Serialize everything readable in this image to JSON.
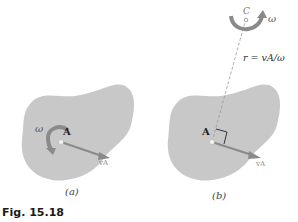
{
  "figure": {
    "caption": "Fig. 15.18",
    "colors": {
      "body_fill": "#c8c8c8",
      "vector": "#8a8a8a",
      "dashed_line": "#999999",
      "point": "#f2f2f2"
    },
    "panel_a": {
      "sublabel": "(a)",
      "point_label": "A",
      "angular_velocity_label": "ω",
      "velocity_label": "vA"
    },
    "panel_b": {
      "sublabel": "(b)",
      "point_label": "A",
      "center_label": "C",
      "angular_velocity_label": "ω",
      "radius_equation": "r = vA/ω",
      "velocity_label": "vA"
    }
  }
}
